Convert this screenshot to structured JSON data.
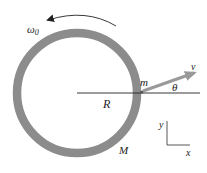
{
  "diagram": {
    "labels": {
      "omega": "ω",
      "omega_sub": "0",
      "mass_point": "m",
      "velocity": "v",
      "angle": "θ",
      "radius": "R",
      "ring_mass": "M",
      "axis_y": "y",
      "axis_x": "x"
    },
    "colors": {
      "ring": "#8c8c8c",
      "arrow": "#999999",
      "line": "#222222"
    }
  }
}
